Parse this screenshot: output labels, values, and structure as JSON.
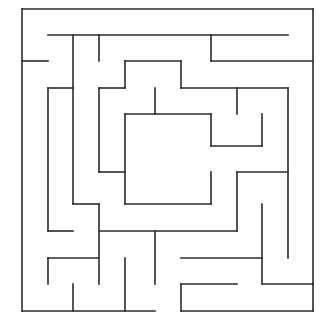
{
  "maze": {
    "background": "#ffffff",
    "wall_color": "#2b2b2b",
    "walls": [
      [
        22,
        9,
        313,
        9
      ],
      [
        22,
        9,
        22,
        311
      ],
      [
        313,
        9,
        313,
        284
      ],
      [
        22,
        61,
        48,
        61
      ],
      [
        48,
        35,
        288,
        35
      ],
      [
        73,
        35,
        73,
        204
      ],
      [
        99,
        35,
        99,
        61
      ],
      [
        211,
        35,
        211,
        61
      ],
      [
        211,
        61,
        313,
        61
      ],
      [
        125,
        61,
        181,
        61
      ],
      [
        125,
        61,
        125,
        88
      ],
      [
        99,
        88,
        125,
        88
      ],
      [
        99,
        88,
        99,
        172
      ],
      [
        99,
        172,
        125,
        172
      ],
      [
        181,
        61,
        181,
        88
      ],
      [
        181,
        88,
        288,
        88
      ],
      [
        237,
        88,
        237,
        114
      ],
      [
        288,
        88,
        288,
        258
      ],
      [
        155,
        88,
        155,
        114
      ],
      [
        125,
        114,
        211,
        114
      ],
      [
        125,
        114,
        125,
        204
      ],
      [
        211,
        114,
        211,
        146
      ],
      [
        211,
        146,
        262,
        146
      ],
      [
        262,
        114,
        262,
        146
      ],
      [
        125,
        204,
        211,
        204
      ],
      [
        211,
        172,
        211,
        204
      ],
      [
        48,
        88,
        73,
        88
      ],
      [
        48,
        88,
        48,
        231
      ],
      [
        48,
        231,
        73,
        231
      ],
      [
        73,
        204,
        99,
        204
      ],
      [
        99,
        204,
        99,
        284
      ],
      [
        99,
        231,
        237,
        231
      ],
      [
        237,
        172,
        237,
        231
      ],
      [
        237,
        172,
        288,
        172
      ],
      [
        155,
        231,
        155,
        284
      ],
      [
        48,
        258,
        99,
        258
      ],
      [
        48,
        258,
        48,
        284
      ],
      [
        73,
        284,
        73,
        311
      ],
      [
        125,
        258,
        125,
        311
      ],
      [
        22,
        311,
        155,
        311
      ],
      [
        181,
        258,
        262,
        258
      ],
      [
        262,
        204,
        262,
        284
      ],
      [
        262,
        284,
        313,
        284
      ],
      [
        181,
        284,
        237,
        284
      ],
      [
        181,
        284,
        181,
        311
      ],
      [
        181,
        311,
        313,
        311
      ],
      [
        313,
        284,
        313,
        311
      ]
    ]
  }
}
